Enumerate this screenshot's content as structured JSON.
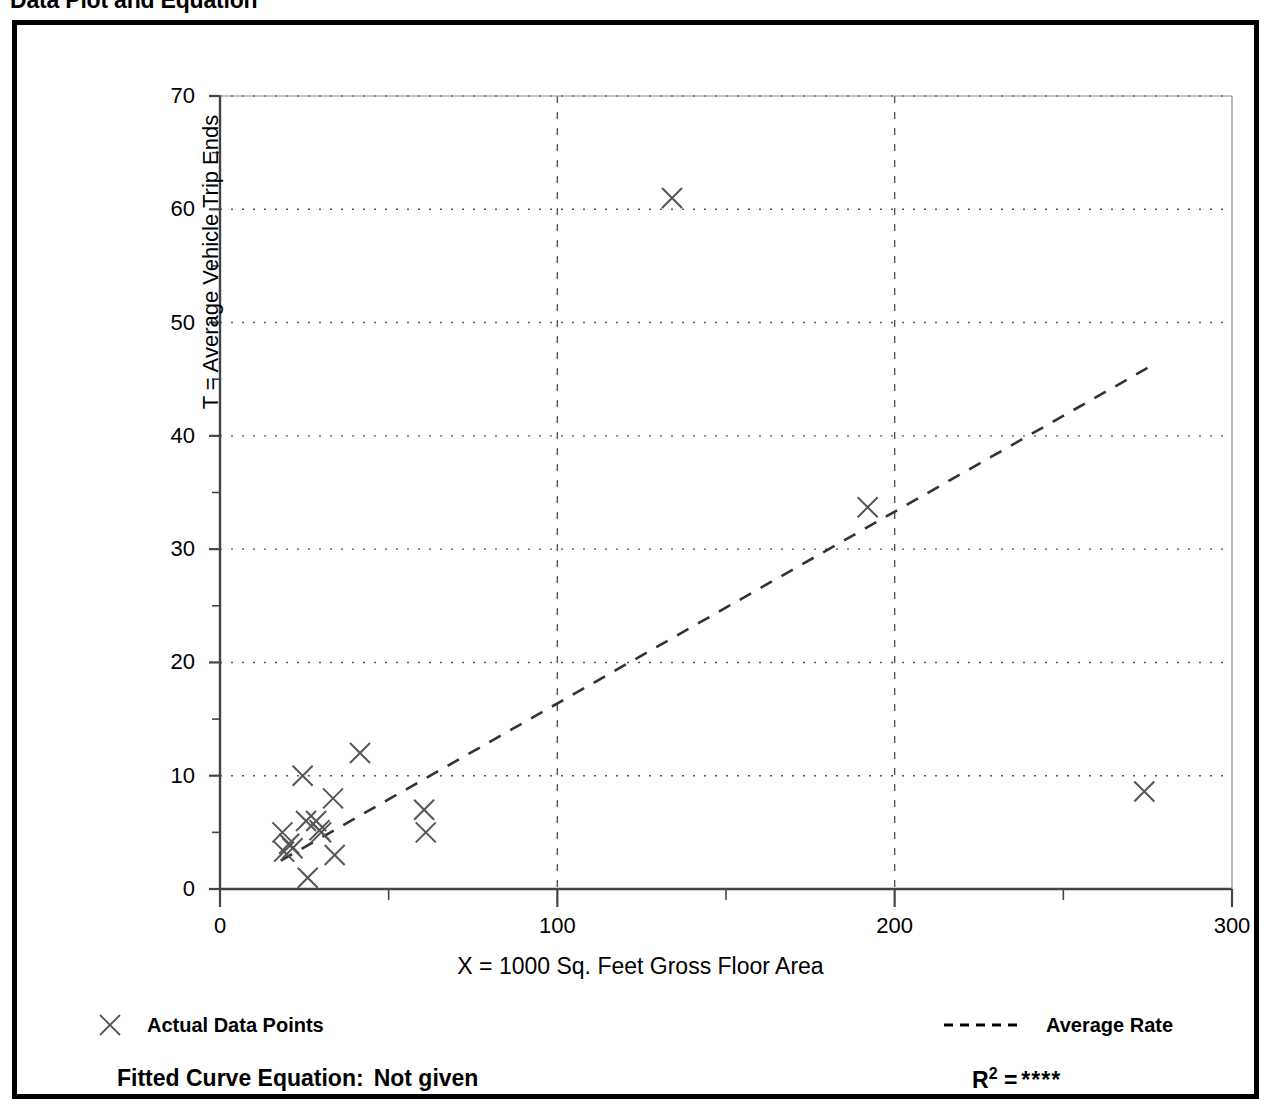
{
  "page": {
    "title": "Data Plot and Equation"
  },
  "chart_data": {
    "type": "scatter",
    "title": "Data Plot and Equation",
    "xlabel": "X = 1000 Sq. Feet Gross Floor Area",
    "ylabel": "T = Average Vehicle Trip Ends",
    "xlim": [
      0,
      300
    ],
    "ylim": [
      0,
      70
    ],
    "xticks": [
      0,
      100,
      200,
      300
    ],
    "xtick_labels": [
      "0",
      "100",
      "200",
      "300"
    ],
    "xminor_ticks": [
      50,
      150,
      250
    ],
    "yticks": [
      0,
      10,
      20,
      30,
      40,
      50,
      60,
      70
    ],
    "ytick_labels": [
      "0",
      "10",
      "20",
      "30",
      "40",
      "50",
      "60",
      "70"
    ],
    "yminor_ticks": [
      5,
      15,
      25,
      35,
      45,
      55,
      65
    ],
    "grid": "horizontal-and-vertical-dotted",
    "legend_position": "below-axes",
    "series": [
      {
        "name": "Actual Data Points",
        "type": "scatter",
        "marker": "x",
        "points": [
          [
            18.5,
            5.0
          ],
          [
            19.0,
            3.3
          ],
          [
            20.5,
            4.0
          ],
          [
            21.5,
            3.6
          ],
          [
            24.5,
            10.0
          ],
          [
            25.5,
            6.0
          ],
          [
            26.0,
            1.0
          ],
          [
            28.5,
            6.0
          ],
          [
            29.5,
            5.2
          ],
          [
            30.0,
            5.0
          ],
          [
            33.5,
            8.0
          ],
          [
            34.0,
            3.0
          ],
          [
            41.5,
            12.0
          ],
          [
            60.5,
            7.0
          ],
          [
            61.0,
            5.0
          ],
          [
            134.0,
            61.0
          ],
          [
            192.0,
            33.7
          ],
          [
            274.0,
            8.6
          ]
        ]
      },
      {
        "name": "Average Rate",
        "type": "line",
        "style": "dashed",
        "points": [
          [
            18.0,
            2.5
          ],
          [
            275.0,
            46.0
          ]
        ]
      }
    ],
    "annotations": {
      "fitted_curve_label": "Fitted Curve Equation:",
      "fitted_curve_value": "Not given",
      "r_squared_label": "R",
      "r_squared_exponent": "2",
      "r_squared_equals": "=",
      "r_squared_value": "****"
    }
  },
  "legend": {
    "entries": [
      {
        "marker": "x-marker-icon",
        "label": "Actual Data Points"
      },
      {
        "marker": "dashed-line-icon",
        "label": "Average Rate"
      }
    ]
  },
  "colors": {
    "ink": "#000000",
    "plot_line": "#555555",
    "axis": "#444444",
    "background": "#ffffff"
  }
}
